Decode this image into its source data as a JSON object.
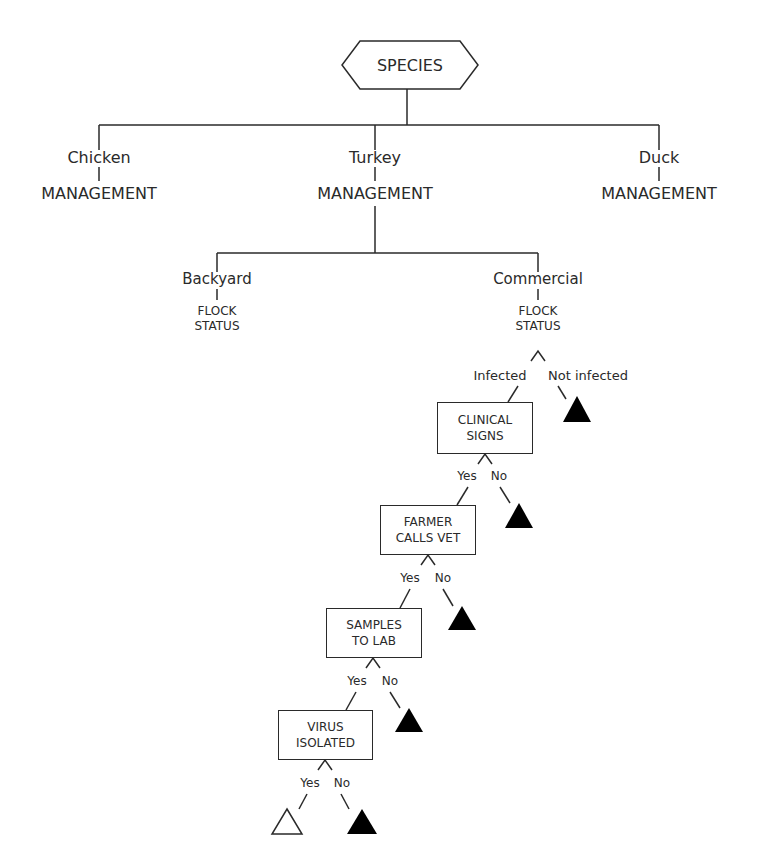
{
  "root": {
    "label": "SPECIES",
    "shape": "hexagon"
  },
  "species": [
    {
      "label": "Chicken",
      "child": "MANAGEMENT"
    },
    {
      "label": "Turkey",
      "child": "MANAGEMENT"
    },
    {
      "label": "Duck",
      "child": "MANAGEMENT"
    }
  ],
  "management": [
    {
      "label": "Backyard",
      "child_line1": "FLOCK",
      "child_line2": "STATUS"
    },
    {
      "label": "Commercial",
      "child_line1": "FLOCK",
      "child_line2": "STATUS"
    }
  ],
  "flock_status_branches": {
    "yes": "Infected",
    "no": "Not infected"
  },
  "decision_nodes": [
    {
      "line1": "CLINICAL",
      "line2": "SIGNS",
      "yes": "Yes",
      "no": "No"
    },
    {
      "line1": "FARMER",
      "line2": "CALLS VET",
      "yes": "Yes",
      "no": "No"
    },
    {
      "line1": "SAMPLES",
      "line2": "TO LAB",
      "yes": "Yes",
      "no": "No"
    },
    {
      "line1": "VIRUS",
      "line2": "ISOLATED",
      "yes": "Yes",
      "no": "No"
    }
  ],
  "outcomes": {
    "detected": "open-triangle",
    "not_detected": "filled-triangle"
  },
  "colors": {
    "line": "#2a2a2a",
    "fill": "#000000",
    "background": "#ffffff"
  }
}
